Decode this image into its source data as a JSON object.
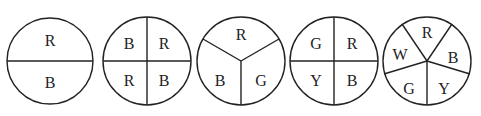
{
  "figure": {
    "spinners": [
      {
        "id": 1,
        "center": [
          50,
          61
        ],
        "radius": 43,
        "dividers": [
          [
            [
              7,
              61
            ],
            [
              93,
              61
            ]
          ]
        ],
        "labels": [
          {
            "text": "R",
            "x": 50,
            "y": 40
          },
          {
            "text": "B",
            "x": 50,
            "y": 82
          }
        ]
      },
      {
        "id": 2,
        "center": [
          147,
          61
        ],
        "radius": 44,
        "dividers": [
          [
            [
              103,
              61
            ],
            [
              191,
              61
            ]
          ],
          [
            [
              147,
              17
            ],
            [
              147,
              105
            ]
          ]
        ],
        "labels": [
          {
            "text": "B",
            "x": 129,
            "y": 43
          },
          {
            "text": "R",
            "x": 164,
            "y": 43
          },
          {
            "text": "R",
            "x": 129,
            "y": 80
          },
          {
            "text": "B",
            "x": 164,
            "y": 80
          }
        ]
      },
      {
        "id": 3,
        "center": [
          241,
          61
        ],
        "radius": 44,
        "dividers": [
          [
            [
              241,
              61
            ],
            [
              241,
              105
            ]
          ],
          [
            [
              241,
              61
            ],
            [
              203,
              39
            ]
          ],
          [
            [
              241,
              61
            ],
            [
              279,
              39
            ]
          ]
        ],
        "labels": [
          {
            "text": "R",
            "x": 241,
            "y": 34
          },
          {
            "text": "B",
            "x": 220,
            "y": 80
          },
          {
            "text": "G",
            "x": 261,
            "y": 80
          }
        ]
      },
      {
        "id": 4,
        "center": [
          334,
          61
        ],
        "radius": 44,
        "dividers": [
          [
            [
              290,
              61
            ],
            [
              378,
              61
            ]
          ],
          [
            [
              334,
              17
            ],
            [
              334,
              105
            ]
          ]
        ],
        "labels": [
          {
            "text": "G",
            "x": 316,
            "y": 43
          },
          {
            "text": "R",
            "x": 352,
            "y": 43
          },
          {
            "text": "Y",
            "x": 316,
            "y": 80
          },
          {
            "text": "B",
            "x": 352,
            "y": 80
          }
        ]
      },
      {
        "id": 5,
        "center": [
          427,
          61
        ],
        "radius": 44,
        "dividers": [
          [
            [
              427,
              61
            ],
            [
              427,
              105
            ]
          ],
          [
            [
              427,
              61
            ],
            [
              402,
              24
            ]
          ],
          [
            [
              427,
              61
            ],
            [
              452,
              24
            ]
          ],
          [
            [
              427,
              61
            ],
            [
              384,
              74
            ]
          ],
          [
            [
              427,
              61
            ],
            [
              470,
              74
            ]
          ]
        ],
        "labels": [
          {
            "text": "R",
            "x": 427,
            "y": 32
          },
          {
            "text": "W",
            "x": 400,
            "y": 54
          },
          {
            "text": "B",
            "x": 453,
            "y": 57
          },
          {
            "text": "G",
            "x": 409,
            "y": 88
          },
          {
            "text": "Y",
            "x": 444,
            "y": 88
          }
        ]
      }
    ]
  }
}
